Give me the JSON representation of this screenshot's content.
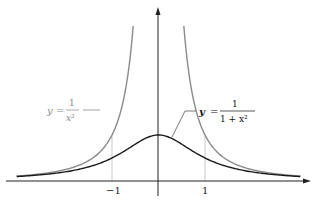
{
  "diagram": {
    "curves": [
      {
        "name": "y = 1/x^2",
        "label_y": "y",
        "label_eq": "=",
        "label_num": "1",
        "label_den": "x²",
        "color": "#8a8a8a"
      },
      {
        "name": "y = 1/(1+x^2)",
        "label_y": "y",
        "label_eq": "=",
        "label_num": "1",
        "label_den": "1 + x²",
        "color": "#1a1a1a"
      }
    ],
    "x_ticks": [
      {
        "value": -1,
        "label": "−1"
      },
      {
        "value": 1,
        "label": "1"
      }
    ],
    "grid_color": "#c8c8c8",
    "axis_color": "#222222"
  }
}
